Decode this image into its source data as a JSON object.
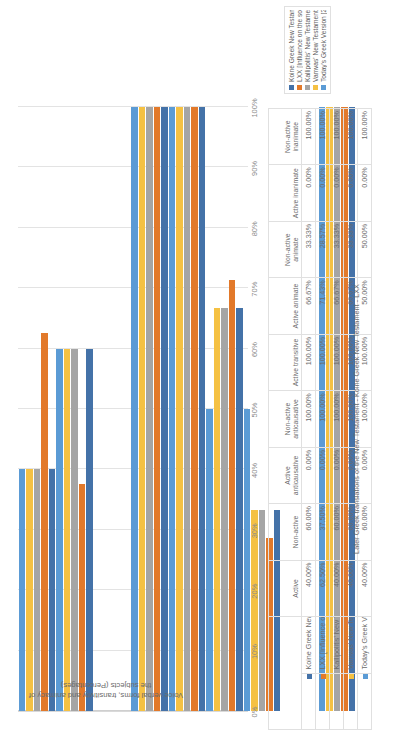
{
  "chart_data": {
    "type": "bar",
    "orientation": "horizontal",
    "title": "",
    "xlabel": "Later Greek translations of the New Testament - Koine Greek New Testament - LXX",
    "ylabel": "Voice verbal forms, transitivity and animacy of the subjects (Percentages)",
    "ylim": [
      0,
      100
    ],
    "grid": true,
    "legend_position": "bottom-right",
    "tick_labels": [
      "0%",
      "10%",
      "20%",
      "30%",
      "40%",
      "50%",
      "60%",
      "70%",
      "80%",
      "90%",
      "100%"
    ],
    "categories": [
      "Active",
      "Non-active",
      "Active anticausative",
      "Non-active anticausative",
      "Active transitive",
      "Active animate",
      "Non-active animate",
      "Active inanimate",
      "Non-active inanimate"
    ],
    "series": [
      {
        "name": "Koine Greek New Testament [Source text]",
        "color": "#4472a8",
        "values": [
          40.0,
          60.0,
          0.0,
          100.0,
          100.0,
          66.67,
          33.33,
          0.0,
          100.0
        ],
        "labels": [
          "40.00%",
          "60.00%",
          "0.00%",
          "100.00%",
          "100.00%",
          "66.67%",
          "33.33%",
          "0.00%",
          "100.00%"
        ]
      },
      {
        "name": "LXX [Influence on the source and target texts]",
        "color": "#e2792a",
        "values": [
          62.5,
          37.5,
          0.0,
          100.0,
          100.0,
          71.43,
          28.57,
          0.0,
          100.0
        ],
        "labels": [
          "62.50%",
          "37.50%",
          "0.00%",
          "100.00%",
          "100.00%",
          "71.43%",
          "28.57%",
          "0.00%",
          "100.00%"
        ]
      },
      {
        "name": "Kallipolitis' New Testament  [17th century]",
        "color": "#a5a5a5",
        "values": [
          40.0,
          60.0,
          0.0,
          100.0,
          100.0,
          66.67,
          33.33,
          0.0,
          100.0
        ],
        "labels": [
          "40.00%",
          "60.00%",
          "0.00%",
          "100.00%",
          "100.00%",
          "66.67%",
          "33.33%",
          "0.00%",
          "100.00%"
        ]
      },
      {
        "name": "Vamvas' New Testament [19th century]",
        "color": "#f5c143",
        "values": [
          40.0,
          60.0,
          0.0,
          100.0,
          100.0,
          66.67,
          33.33,
          0.0,
          100.0
        ],
        "labels": [
          "40.00%",
          "60.00%",
          "0.00%",
          "100.00%",
          "100.00%",
          "66.67%",
          "33.33%",
          "0.00%",
          "100.00%"
        ]
      },
      {
        "name": "Today's Greek Version [20th century]",
        "color": "#5b9bd5",
        "values": [
          40.0,
          60.0,
          0.0,
          100.0,
          100.0,
          50.0,
          50.0,
          0.0,
          100.0
        ],
        "labels": [
          "40.00%",
          "60.00%",
          "0.00%",
          "100.00%",
          "100.00%",
          "50.00%",
          "50.00%",
          "0.00%",
          "100.00%"
        ]
      }
    ]
  },
  "table": {
    "column_headers": [
      "Active",
      "Non-active",
      "Active anticausative",
      "Non-active anticausative",
      "Active transitive",
      "Active animate",
      "Non-active animate",
      "Active inanimate",
      "Non-active inanimate"
    ],
    "rows": [
      {
        "label": "Koine Greek New Testament [Source text]",
        "color": "#4472a8",
        "cells": [
          "40.00%",
          "60.00%",
          "0.00%",
          "100.00%",
          "100.00%",
          "66.67%",
          "33.33%",
          "0.00%",
          "100.00%"
        ]
      },
      {
        "label": "LXX [Influence on the source and target texts]",
        "color": "#e2792a",
        "cells": [
          "62.50%",
          "37.50%",
          "0.00%",
          "100.00%",
          "100.00%",
          "71.43%",
          "28.57%",
          "0.00%",
          "100.00%"
        ]
      },
      {
        "label": "Kallipolitis' New Testament  [17th century]",
        "color": "#a5a5a5",
        "cells": [
          "40.00%",
          "60.00%",
          "0.00%",
          "100.00%",
          "100.00%",
          "66.67%",
          "33.33%",
          "0.00%",
          "100.00%"
        ]
      },
      {
        "label": "Vamvas' New Testament [19th century]",
        "color": "#f5c143",
        "cells": [
          "40.00%",
          "60.00%",
          "0.00%",
          "100.00%",
          "100.00%",
          "66.67%",
          "33.33%",
          "0.00%",
          "100.00%"
        ]
      },
      {
        "label": "Today's Greek Version [20th century]",
        "color": "#5b9bd5",
        "cells": [
          "40.00%",
          "60.00%",
          "0.00%",
          "100.00%",
          "100.00%",
          "50.00%",
          "50.00%",
          "0.00%",
          "100.00%"
        ]
      }
    ]
  },
  "axis_title": "Later Greek translations of the New Testament - Koine Greek New Testament - LXX",
  "value_axis_title": "Voice verbal forms, transitivity and animacy of the subjects (Percentages)",
  "legend": {
    "items": [
      {
        "label": "Koine Greek New Testament [Source text]",
        "color": "#4472a8"
      },
      {
        "label": "LXX [Influence on the source and target texts]",
        "color": "#e2792a"
      },
      {
        "label": "Kallipolitis' New Testament  [17th century]",
        "color": "#a5a5a5"
      },
      {
        "label": "Vamvas' New Testament [19th century]",
        "color": "#f5c143"
      },
      {
        "label": "Today's Greek Version [20th century]",
        "color": "#5b9bd5"
      }
    ]
  }
}
